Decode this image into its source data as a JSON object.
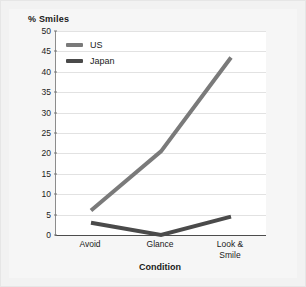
{
  "chart_data": {
    "type": "line",
    "title": "",
    "ylabel": "% Smiles",
    "xlabel": "Condition",
    "categories": [
      "Avoid",
      "Glance",
      "Look &\nSmile"
    ],
    "series": [
      {
        "name": "US",
        "values": [
          6,
          20.5,
          43.5
        ],
        "color": "#7a7a7a"
      },
      {
        "name": "Japan",
        "values": [
          3,
          0,
          4.5
        ],
        "color": "#4a4a4a"
      }
    ],
    "ylim": [
      0,
      50
    ],
    "yticks": [
      0,
      5,
      10,
      15,
      20,
      25,
      30,
      35,
      40,
      45,
      50
    ],
    "grid": "horizontal",
    "legend_position": "top-left-inside"
  },
  "axes": {
    "y_title": "% Smiles",
    "x_title": "Condition",
    "y_tick_labels": [
      "50",
      "45",
      "40",
      "35",
      "30",
      "25",
      "20",
      "15",
      "10",
      "5",
      "0"
    ],
    "x_tick_labels": [
      {
        "line1": "Avoid",
        "line2": ""
      },
      {
        "line1": "Glance",
        "line2": ""
      },
      {
        "line1": "Look &",
        "line2": "Smile"
      }
    ]
  },
  "legend": {
    "items": [
      {
        "label": "US",
        "color": "#7a7a7a"
      },
      {
        "label": "Japan",
        "color": "#4a4a4a"
      }
    ]
  },
  "colors": {
    "page_background": "#f2f2f2",
    "canvas_background": "#f6f6f6",
    "plot_background": "#ffffff",
    "gridline": "#e2e2e2",
    "axis_line": "#4d4d4d",
    "text": "#1a1a1a",
    "us_series": "#7a7a7a",
    "japan_series": "#4a4a4a"
  }
}
